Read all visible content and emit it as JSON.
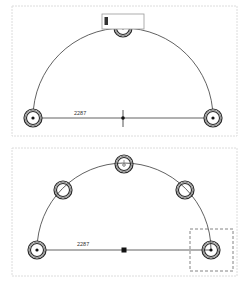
{
  "panels": [
    {
      "id": "top",
      "dimension_label": "2287",
      "arc": {
        "cx": 123,
        "cy": 118,
        "r": 90
      },
      "nodes": [
        {
          "name": "left",
          "x": 33,
          "y": 118,
          "dot": true
        },
        {
          "name": "right",
          "x": 213,
          "y": 118,
          "dot": true
        },
        {
          "name": "top",
          "x": 123,
          "y": 28,
          "dot": false
        }
      ],
      "center_marker": "cross",
      "overlay_box": {
        "x": 102,
        "y": 14,
        "w": 42,
        "h": 15
      }
    },
    {
      "id": "bottom",
      "dimension_label": "2287",
      "arc": {
        "cx": 124,
        "cy": 250,
        "r": 87
      },
      "nodes": [
        {
          "name": "left",
          "x": 37,
          "y": 250,
          "dot": true
        },
        {
          "name": "upper-left",
          "x": 63,
          "y": 190,
          "dot": false
        },
        {
          "name": "top",
          "x": 124,
          "y": 164,
          "dot": false
        },
        {
          "name": "upper-right",
          "x": 185,
          "y": 190,
          "dot": false
        },
        {
          "name": "right",
          "x": 211,
          "y": 250,
          "dot": true
        }
      ],
      "center_marker": "square",
      "selection_box": {
        "x": 190,
        "y": 229,
        "w": 43,
        "h": 42
      }
    }
  ],
  "colors": {
    "line": "#3a3a3a",
    "frame": "#dcdcdc",
    "background": "#ffffff"
  }
}
